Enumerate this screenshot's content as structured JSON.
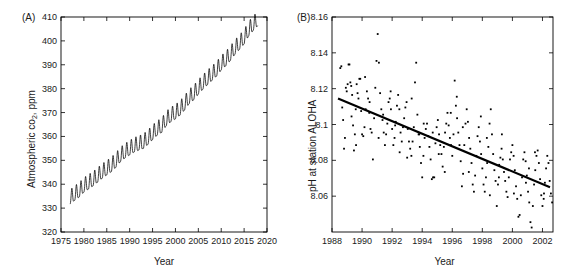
{
  "figure": {
    "xlabel_shared": "Year",
    "background": "#ffffff",
    "line_color": "#000000",
    "marker_color": "#000000"
  },
  "panels": {
    "a": {
      "tag": "(A)",
      "ylabel_pre": "Atmospheric co",
      "ylabel_sub": "2",
      "ylabel_post": ", ppm",
      "xlabel": "Year",
      "xticks": [
        1975,
        1980,
        1985,
        1990,
        1995,
        2000,
        2005,
        2010,
        2015,
        2020
      ],
      "yticks": [
        320,
        330,
        340,
        350,
        360,
        370,
        380,
        390,
        400,
        410
      ]
    },
    "b": {
      "tag": "(B)",
      "ylabel": "pH at station ALOHA",
      "xlabel": "Year",
      "xticks": [
        1988,
        1990,
        1992,
        1994,
        1996,
        1998,
        2000,
        2002
      ],
      "yticks": [
        "8.06",
        "8.08",
        "8.1",
        "8.12",
        "8.14",
        "8.16"
      ]
    }
  },
  "chart_data": [
    {
      "type": "line",
      "panel": "A",
      "title": "",
      "xlabel": "Year",
      "ylabel": "Atmospheric co2, ppm",
      "xlim": [
        1975,
        2020
      ],
      "ylim": [
        320,
        410
      ],
      "grid": false,
      "legend": "none",
      "description": "Keeling curve: monthly mean atmospheric CO2 showing a rising trend with annual sawtooth seasonal oscillation of about 6 ppm peak-to-trough.",
      "seasonal_amplitude_ppm": 6.0,
      "annual_trend": {
        "x": [
          1977,
          1978,
          1979,
          1980,
          1981,
          1982,
          1983,
          1984,
          1985,
          1986,
          1987,
          1988,
          1989,
          1990,
          1991,
          1992,
          1993,
          1994,
          1995,
          1996,
          1997,
          1998,
          1999,
          2000,
          2001,
          2002,
          2003,
          2004,
          2005,
          2006,
          2007,
          2008,
          2009,
          2010,
          2011,
          2012,
          2013,
          2014,
          2015,
          2016,
          2017,
          2018
        ],
        "y": [
          333.8,
          335.4,
          336.8,
          338.8,
          340.1,
          341.4,
          343.0,
          344.6,
          346.0,
          347.4,
          349.2,
          351.6,
          353.1,
          354.4,
          355.6,
          356.4,
          357.1,
          358.8,
          360.8,
          362.6,
          363.8,
          366.6,
          368.3,
          369.5,
          371.0,
          373.2,
          375.8,
          377.5,
          379.8,
          381.9,
          383.8,
          385.6,
          387.4,
          389.9,
          391.7,
          393.9,
          396.5,
          398.6,
          400.8,
          404.2,
          406.5,
          408.5
        ]
      }
    },
    {
      "type": "scatter",
      "panel": "B",
      "title": "",
      "xlabel": "Year",
      "ylabel": "pH at station ALOHA",
      "xlim": [
        1988,
        2002.7
      ],
      "ylim": [
        8.04,
        8.16
      ],
      "grid": false,
      "legend": "none",
      "description": "Seawater pH observations at station ALOHA with a fitted linear decline (ocean acidification).",
      "trendline": {
        "x": [
          1988.4,
          2002.5
        ],
        "y": [
          8.1145,
          8.065
        ],
        "slope_per_year": -0.00351
      },
      "points": [
        [
          1988.55,
          8.1315
        ],
        [
          1988.62,
          8.1325
        ],
        [
          1988.68,
          8.1095
        ],
        [
          1988.74,
          8.1025
        ],
        [
          1988.8,
          8.0865
        ],
        [
          1988.86,
          8.0925
        ],
        [
          1988.92,
          8.1205
        ],
        [
          1988.98,
          8.1185
        ],
        [
          1989.04,
          8.1225
        ],
        [
          1989.1,
          8.1335
        ],
        [
          1989.16,
          8.1335
        ],
        [
          1989.22,
          8.1235
        ],
        [
          1989.28,
          8.1215
        ],
        [
          1989.34,
          8.1165
        ],
        [
          1989.4,
          8.0995
        ],
        [
          1989.46,
          8.0855
        ],
        [
          1989.52,
          8.0945
        ],
        [
          1989.58,
          8.1085
        ],
        [
          1989.64,
          8.1225
        ],
        [
          1989.7,
          8.1175
        ],
        [
          1989.76,
          8.1145
        ],
        [
          1989.82,
          8.1255
        ],
        [
          1989.88,
          8.1255
        ],
        [
          1989.94,
          8.1075
        ],
        [
          1990.0,
          8.0945
        ],
        [
          1990.08,
          8.0935
        ],
        [
          1990.16,
          8.0985
        ],
        [
          1990.24,
          8.1085
        ],
        [
          1990.32,
          8.1185
        ],
        [
          1990.4,
          8.1145
        ],
        [
          1990.48,
          8.1065
        ],
        [
          1990.56,
          8.0975
        ],
        [
          1990.64,
          8.0955
        ],
        [
          1990.72,
          8.0805
        ],
        [
          1990.8,
          8.1035
        ],
        [
          1990.88,
          8.1205
        ],
        [
          1990.96,
          8.1355
        ],
        [
          1991.04,
          8.1505
        ],
        [
          1991.12,
          8.1345
        ],
        [
          1991.2,
          8.1175
        ],
        [
          1991.28,
          8.1085
        ],
        [
          1991.36,
          8.1025
        ],
        [
          1991.44,
          8.0955
        ],
        [
          1991.52,
          8.0885
        ],
        [
          1991.6,
          8.0945
        ],
        [
          1991.68,
          8.1005
        ],
        [
          1991.76,
          8.1125
        ],
        [
          1991.84,
          8.1145
        ],
        [
          1991.92,
          8.1085
        ],
        [
          1992.0,
          8.0975
        ],
        [
          1992.08,
          8.0885
        ],
        [
          1992.16,
          8.0925
        ],
        [
          1992.24,
          8.1015
        ],
        [
          1992.32,
          8.1105
        ],
        [
          1992.4,
          8.1165
        ],
        [
          1992.48,
          8.1085
        ],
        [
          1992.56,
          8.0955
        ],
        [
          1992.64,
          8.0905
        ],
        [
          1992.72,
          8.0985
        ],
        [
          1992.8,
          8.1035
        ],
        [
          1992.88,
          8.1095
        ],
        [
          1992.96,
          8.1125
        ],
        [
          1993.04,
          8.0975
        ],
        [
          1993.12,
          8.0905
        ],
        [
          1993.2,
          8.0865
        ],
        [
          1993.28,
          8.0825
        ],
        [
          1993.36,
          8.0905
        ],
        [
          1993.44,
          8.0985
        ],
        [
          1993.52,
          8.1235
        ],
        [
          1993.6,
          8.1345
        ],
        [
          1993.68,
          8.1055
        ],
        [
          1993.76,
          8.0945
        ],
        [
          1993.84,
          8.0875
        ],
        [
          1993.92,
          8.0785
        ],
        [
          1994.0,
          8.0705
        ],
        [
          1994.08,
          8.0825
        ],
        [
          1994.16,
          8.0925
        ],
        [
          1994.24,
          8.0975
        ],
        [
          1994.32,
          8.1005
        ],
        [
          1994.4,
          8.0935
        ],
        [
          1994.48,
          8.0875
        ],
        [
          1994.56,
          8.0805
        ],
        [
          1994.64,
          8.0695
        ],
        [
          1994.72,
          8.0705
        ],
        [
          1994.8,
          8.0705
        ],
        [
          1994.88,
          8.0895
        ],
        [
          1994.96,
          8.0985
        ],
        [
          1995.04,
          8.1025
        ],
        [
          1995.12,
          8.0945
        ],
        [
          1995.2,
          8.0885
        ],
        [
          1995.28,
          8.0835
        ],
        [
          1995.36,
          8.0765
        ],
        [
          1995.44,
          8.0875
        ],
        [
          1995.52,
          8.0955
        ],
        [
          1995.6,
          8.1005
        ],
        [
          1995.68,
          8.1065
        ],
        [
          1995.76,
          8.0995
        ],
        [
          1995.84,
          8.0925
        ],
        [
          1995.92,
          8.0885
        ],
        [
          1996.0,
          8.0825
        ],
        [
          1996.08,
          8.0945
        ],
        [
          1996.16,
          8.1245
        ],
        [
          1996.24,
          8.1105
        ],
        [
          1996.32,
          8.1035
        ],
        [
          1996.4,
          8.0955
        ],
        [
          1996.48,
          8.0885
        ],
        [
          1996.56,
          8.0795
        ],
        [
          1996.64,
          8.0655
        ],
        [
          1996.72,
          8.0725
        ],
        [
          1996.8,
          8.0885
        ],
        [
          1996.88,
          8.1005
        ],
        [
          1996.96,
          8.1085
        ],
        [
          1997.04,
          8.1015
        ],
        [
          1997.12,
          8.0925
        ],
        [
          1997.2,
          8.0865
        ],
        [
          1997.28,
          8.0785
        ],
        [
          1997.36,
          8.0665
        ],
        [
          1997.44,
          8.0625
        ],
        [
          1997.52,
          8.0715
        ],
        [
          1997.6,
          8.0825
        ],
        [
          1997.68,
          8.0935
        ],
        [
          1997.76,
          8.0985
        ],
        [
          1997.84,
          8.0905
        ],
        [
          1997.92,
          8.0835
        ],
        [
          1998.0,
          8.0755
        ],
        [
          1998.08,
          8.0665
        ],
        [
          1998.16,
          8.0625
        ],
        [
          1998.24,
          8.0705
        ],
        [
          1998.32,
          8.0785
        ],
        [
          1998.4,
          8.0875
        ],
        [
          1998.48,
          8.1005
        ],
        [
          1998.56,
          8.1085
        ],
        [
          1998.64,
          8.0945
        ],
        [
          1998.72,
          8.0835
        ],
        [
          1998.8,
          8.0745
        ],
        [
          1998.88,
          8.0685
        ],
        [
          1998.96,
          8.0545
        ],
        [
          1999.04,
          8.0665
        ],
        [
          1999.12,
          8.0775
        ],
        [
          1999.2,
          8.0815
        ],
        [
          1999.28,
          8.0865
        ],
        [
          1999.36,
          8.0805
        ],
        [
          1999.44,
          8.0735
        ],
        [
          1999.52,
          8.0685
        ],
        [
          1999.6,
          8.0625
        ],
        [
          1999.68,
          8.0595
        ],
        [
          1999.76,
          8.0705
        ],
        [
          1999.84,
          8.0805
        ],
        [
          1999.92,
          8.0845
        ],
        [
          2000.0,
          8.0885
        ],
        [
          2000.08,
          8.0825
        ],
        [
          2000.16,
          8.0745
        ],
        [
          2000.24,
          8.0655
        ],
        [
          2000.32,
          8.0585
        ],
        [
          2000.4,
          8.0485
        ],
        [
          2000.48,
          8.0495
        ],
        [
          2000.56,
          8.0605
        ],
        [
          2000.64,
          8.0705
        ],
        [
          2000.72,
          8.0805
        ],
        [
          2000.8,
          8.0845
        ],
        [
          2000.88,
          8.0795
        ],
        [
          2000.96,
          8.0715
        ],
        [
          2001.04,
          8.0625
        ],
        [
          2001.12,
          8.0565
        ],
        [
          2001.2,
          8.0455
        ],
        [
          2001.28,
          8.0425
        ],
        [
          2001.36,
          8.0545
        ],
        [
          2001.44,
          8.0665
        ],
        [
          2001.52,
          8.0745
        ],
        [
          2001.6,
          8.0825
        ],
        [
          2001.68,
          8.0855
        ],
        [
          2001.76,
          8.0785
        ],
        [
          2001.84,
          8.0695
        ],
        [
          2001.92,
          8.0605
        ],
        [
          2002.0,
          8.0545
        ],
        [
          2002.08,
          8.0585
        ],
        [
          2002.16,
          8.0675
        ],
        [
          2002.24,
          8.0755
        ],
        [
          2002.32,
          8.0825
        ],
        [
          2002.4,
          8.0785
        ],
        [
          2002.48,
          8.0685
        ],
        [
          2002.56,
          8.0615
        ],
        [
          2002.64,
          8.0565
        ],
        [
          1989.3,
          8.1045
        ],
        [
          1990.5,
          8.1125
        ],
        [
          1991.1,
          8.0925
        ],
        [
          1991.9,
          8.1185
        ],
        [
          1992.5,
          8.0845
        ],
        [
          1993.3,
          8.1145
        ],
        [
          1994.1,
          8.1005
        ],
        [
          1994.7,
          8.0955
        ],
        [
          1995.5,
          8.0735
        ],
        [
          1996.3,
          8.1155
        ],
        [
          1997.1,
          8.0735
        ],
        [
          1997.9,
          8.1045
        ],
        [
          1998.5,
          8.0605
        ],
        [
          1999.3,
          8.0945
        ],
        [
          2000.1,
          8.0615
        ],
        [
          2000.9,
          8.0675
        ],
        [
          2001.5,
          8.0845
        ],
        [
          2002.1,
          8.0615
        ],
        [
          1989.6,
          8.0885
        ],
        [
          1990.2,
          8.1265
        ],
        [
          1991.4,
          8.1055
        ],
        [
          1992.2,
          8.0995
        ],
        [
          1993.0,
          8.0815
        ],
        [
          1993.8,
          8.0945
        ],
        [
          1995.1,
          8.0835
        ],
        [
          1995.9,
          8.1065
        ],
        [
          1996.7,
          8.0985
        ],
        [
          1998.3,
          8.0925
        ],
        [
          1999.1,
          8.0705
        ],
        [
          2001.1,
          8.0755
        ]
      ]
    }
  ]
}
